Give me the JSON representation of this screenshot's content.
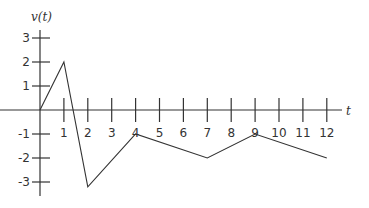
{
  "chart_data": {
    "type": "line",
    "title": "",
    "xlabel": "t",
    "ylabel": "v(t)",
    "x": [
      0,
      1,
      2,
      4,
      7,
      9,
      12
    ],
    "series": [
      {
        "name": "v(t)",
        "values": [
          0,
          2,
          -3.2,
          -1,
          -2,
          -1,
          -2
        ]
      }
    ],
    "x_ticks": [
      1,
      2,
      3,
      4,
      5,
      6,
      7,
      8,
      9,
      10,
      11,
      12
    ],
    "y_ticks": [
      3,
      2,
      1,
      -1,
      -2,
      -3
    ],
    "xlim": [
      0,
      12.6
    ],
    "ylim": [
      -3.6,
      3.4
    ],
    "grid": false,
    "legend": "none"
  },
  "layout": {
    "origin_px": [
      40,
      110
    ],
    "x_unit_px": 23.9,
    "y_unit_px": 24.0,
    "x_axis_end_px": 342,
    "y_axis_top_px": 30,
    "y_axis_bottom_px": 196,
    "line_color": "#333333"
  }
}
